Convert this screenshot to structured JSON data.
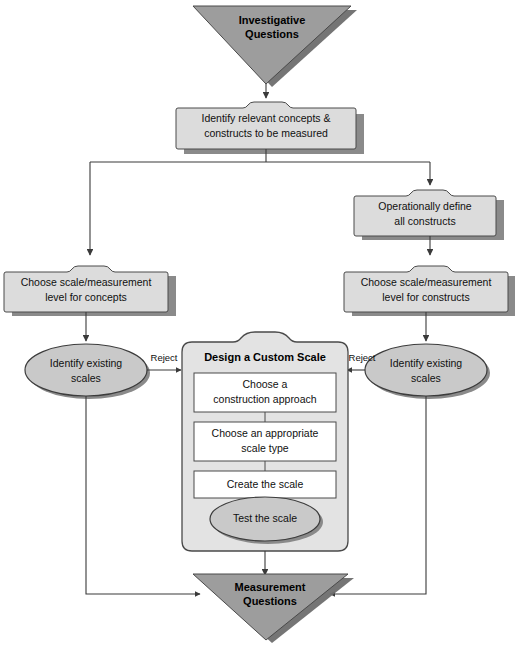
{
  "diagram": {
    "colors": {
      "triangle_fill": "#9d9d9d",
      "triangle_shadow": "#6e6e6e",
      "triangle_stroke": "#4a4a4a",
      "box_fill": "#dcdcdc",
      "box_stroke": "#4a4a4a",
      "box_shadow": "#8a8a8a",
      "ellipse_fill": "#c9c9c9",
      "ellipse_stroke": "#3c3c3c",
      "ellipse_shadow": "#8a8a8a",
      "panel_fill": "#e3e3e3",
      "panel_stroke": "#4a4a4a",
      "inner_box_fill": "#ffffff",
      "inner_box_stroke": "#4a4a4a",
      "line": "#3a3a3a",
      "text": "#101010",
      "background": "#ffffff"
    },
    "nodes": {
      "investigative_questions": {
        "shape": "inverted-triangle",
        "line1": "Investigative",
        "line2": "Questions"
      },
      "identify_concepts": {
        "shape": "tabbed-box",
        "line1": "Identify relevant concepts &",
        "line2": "constructs to be measured"
      },
      "operationally_define": {
        "shape": "tabbed-box",
        "line1": "Operationally define",
        "line2": "all constructs"
      },
      "choose_scale_concepts": {
        "shape": "tabbed-box",
        "line1": "Choose scale/measurement",
        "line2": "level for concepts"
      },
      "choose_scale_constructs": {
        "shape": "tabbed-box",
        "line1": "Choose scale/measurement",
        "line2": "level for constructs"
      },
      "identify_existing_left": {
        "shape": "ellipse",
        "line1": "Identify existing",
        "line2": "scales"
      },
      "identify_existing_right": {
        "shape": "ellipse",
        "line1": "Identify existing",
        "line2": "scales"
      },
      "design_custom_scale": {
        "shape": "tabbed-panel",
        "title": "Design a Custom Scale",
        "steps": [
          {
            "line1": "Choose a",
            "line2": "construction approach"
          },
          {
            "line1": "Choose an appropriate",
            "line2": "scale type"
          },
          {
            "line1": "Create the scale",
            "line2": ""
          }
        ],
        "test_step": "Test the scale"
      },
      "measurement_questions": {
        "shape": "inverted-triangle",
        "line1": "Measurement",
        "line2": "Questions"
      }
    },
    "edge_labels": {
      "reject_left": "Reject",
      "reject_right": "Reject"
    }
  }
}
